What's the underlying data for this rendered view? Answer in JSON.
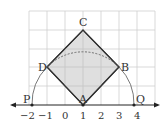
{
  "diagram": {
    "type": "geometry-number-line",
    "grid": {
      "x_min": -2,
      "x_max": 5,
      "y_min": 0,
      "y_max": 5,
      "color": "#cccccc"
    },
    "number_line": {
      "ticks": [
        {
          "value": -2,
          "label": "−2"
        },
        {
          "value": -1,
          "label": "−1"
        },
        {
          "value": 0,
          "label": "0"
        },
        {
          "value": 1,
          "label": "1"
        },
        {
          "value": 2,
          "label": "2"
        },
        {
          "value": 3,
          "label": "3"
        },
        {
          "value": 4,
          "label": "4"
        }
      ]
    },
    "points": {
      "A": {
        "label": "A",
        "x": 1,
        "y": 0
      },
      "B": {
        "label": "B",
        "x": 3,
        "y": 2
      },
      "C": {
        "label": "C",
        "x": 1,
        "y": 4
      },
      "D": {
        "label": "D",
        "x": -1,
        "y": 2
      },
      "P": {
        "label": "P",
        "x": -1.83,
        "y": 0
      },
      "Q": {
        "label": "Q",
        "x": 3.83,
        "y": 0
      }
    },
    "square": {
      "vertices": [
        "A",
        "B",
        "C",
        "D"
      ],
      "fill": "#d9d9d9",
      "stroke": "#333333"
    },
    "arc": {
      "center": "A",
      "radius_sqrt": 8,
      "style": "solid outside square, dashed inside"
    }
  }
}
